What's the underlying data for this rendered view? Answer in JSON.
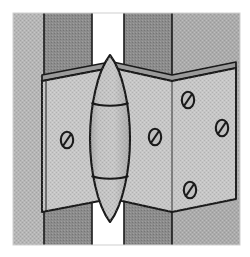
{
  "figure": {
    "canvas": {
      "width": 250,
      "height": 257,
      "background": "#ffffff"
    },
    "image_area": {
      "x": 13,
      "y": 13,
      "width": 227,
      "height": 232
    },
    "palette": {
      "paper_white": "#ffffff",
      "jamb_face_light": "#b6b6b6",
      "jamb_face_dark": "#8c8c8c",
      "door_face_mid": "#ababab",
      "plate_face": "#c6c6c6",
      "plate_edge_dark": "#9a9a9a",
      "barrel_face": "#bdbdbd",
      "outline_black": "#1a1a1a",
      "screw_fill": "#c0c0c0"
    },
    "parts": [
      {
        "id": "jamb-left-outer",
        "label": "Left jamb face (light)",
        "kind": "panel",
        "color": "#b6b6b6",
        "polygon": "13,13 44,13 44,245 13,245"
      },
      {
        "id": "jamb-left-inner",
        "label": "Left jamb return (shadowed)",
        "kind": "panel",
        "color": "#8c8c8c",
        "polygon": "44,13 92,13 92,245 44,245"
      },
      {
        "id": "jamb-right-inner",
        "label": "Right jamb return (shadowed)",
        "kind": "panel",
        "color": "#8c8c8c",
        "polygon": "124,13 172,13 172,245 124,245"
      },
      {
        "id": "door-right-face",
        "label": "Right door face (mid gray)",
        "kind": "panel",
        "color": "#ababab",
        "polygon": "172,13 240,13 240,245 172,245"
      },
      {
        "id": "leaf-left",
        "label": "Left hinge leaf (jamb leaf)",
        "kind": "plate",
        "color": "#c6c6c6",
        "polygon": "42,81 110,68 110,199 42,212"
      },
      {
        "id": "leaf-left-top-edge",
        "label": "Left leaf top thickness edge",
        "kind": "edge",
        "color": "#9a9a9a",
        "polygon": "42,75 110,62 110,68 42,81"
      },
      {
        "id": "leaf-right",
        "label": "Right hinge leaf (door leaf)",
        "kind": "plate",
        "color": "#c6c6c6",
        "polygon": "113,68 172,81 236,68 236,199 172,212 113,199"
      },
      {
        "id": "leaf-right-top-edge",
        "label": "Right leaf top thickness edge",
        "kind": "edge",
        "color": "#9a9a9a",
        "polygon": "113,62 172,75 236,62 236,68 172,81 113,68"
      },
      {
        "id": "barrel",
        "label": "Hinge barrel / knuckle column",
        "kind": "barrel",
        "color": "#bdbdbd",
        "center_x": 110,
        "top_y": 55,
        "bottom_y": 222,
        "half_width": 20
      }
    ],
    "knuckle_joints": [
      {
        "id": "knuckle-joint-upper",
        "y": 103
      },
      {
        "id": "knuckle-joint-lower",
        "y": 176
      }
    ],
    "screws": [
      {
        "id": "screw-left-1",
        "leaf": "left",
        "cx": 67,
        "cy": 140,
        "rx": 6.2,
        "ry": 8.2,
        "slot_angle_deg": 34
      },
      {
        "id": "screw-right-1",
        "leaf": "right",
        "cx": 188,
        "cy": 100,
        "rx": 6.2,
        "ry": 8.2,
        "slot_angle_deg": 34
      },
      {
        "id": "screw-right-2",
        "leaf": "right",
        "cx": 155,
        "cy": 137,
        "rx": 6.2,
        "ry": 8.2,
        "slot_angle_deg": 34
      },
      {
        "id": "screw-right-3",
        "leaf": "right",
        "cx": 222,
        "cy": 128,
        "rx": 6.2,
        "ry": 8.2,
        "slot_angle_deg": 34
      },
      {
        "id": "screw-right-4",
        "leaf": "right",
        "cx": 190,
        "cy": 190,
        "rx": 6.2,
        "ry": 8.2,
        "slot_angle_deg": 34
      }
    ],
    "counts": {
      "screws_total": 5,
      "screws_left_leaf": 1,
      "screws_right_leaf": 4,
      "knuckle_joints": 2
    },
    "captions": {
      "alt_text": "Grayscale line drawing of a butt hinge: a left leaf screwed to a door jamb and a right leaf screwed to the door edge, joined by a vertical barrel with two knuckle joints."
    }
  }
}
